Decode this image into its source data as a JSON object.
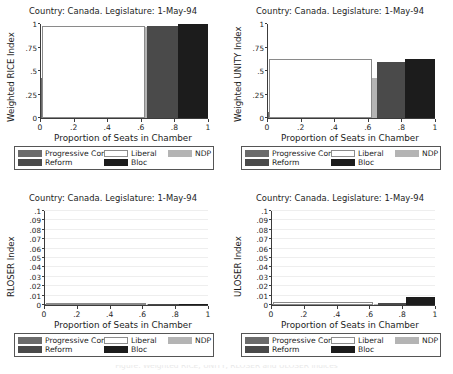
{
  "figure": {
    "width": 453,
    "height": 374,
    "background": "#ffffff",
    "cut_off_caption": "Figure: Weighted RICE, UNITY, RLOSER and ULOSER indices"
  },
  "parties": [
    {
      "key": "pc",
      "label": "Progressive Con",
      "color": "#6b6b6b",
      "outline": false
    },
    {
      "key": "liberal",
      "label": "Liberal",
      "color": "#ffffff",
      "outline": true
    },
    {
      "key": "ndp",
      "label": "NDP",
      "color": "#b4b4b4",
      "outline": false
    },
    {
      "key": "reform",
      "label": "Reform",
      "color": "#4a4a4a",
      "outline": false
    },
    {
      "key": "bloc",
      "label": "Bloc",
      "color": "#1c1c1c",
      "outline": false
    }
  ],
  "legend": {
    "row1": [
      "Progressive Con",
      "Liberal",
      "NDP"
    ],
    "row2": [
      "Reform",
      "Bloc"
    ]
  },
  "panels": [
    {
      "id": "rice",
      "title": "Country: Canada. Legislature: 1-May-94",
      "ylabel": "Weighted RICE Index",
      "xlabel": "Proportion of Seats in Chamber"
    },
    {
      "id": "unity",
      "title": "Country: Canada. Legislature: 1-May-94",
      "ylabel": "Weighted UNITY Index",
      "xlabel": "Proportion of Seats in Chamber"
    },
    {
      "id": "rloser",
      "title": "Country: Canada. Legislature: 1-May-94",
      "ylabel": "RLOSER Index",
      "xlabel": "Proportion of Seats in Chamber"
    },
    {
      "id": "uloser",
      "title": "Country: Canada. Legislature: 1-May-94",
      "ylabel": "ULOSER Index",
      "xlabel": "Proportion of Seats in Chamber"
    }
  ],
  "chart_data": [
    {
      "type": "bar",
      "id": "rice",
      "title": "Country: Canada. Legislature: 1-May-94",
      "xlabel": "Proportion of Seats in Chamber",
      "ylabel": "Weighted RICE Index",
      "xlim": [
        0,
        1
      ],
      "ylim": [
        0,
        1
      ],
      "xticks": [
        0,
        0.2,
        0.4,
        0.6,
        0.8,
        1
      ],
      "xticklabels": [
        "0",
        ".2",
        ".4",
        ".6",
        ".8",
        "1"
      ],
      "yticks": [
        0,
        0.25,
        0.5,
        0.75,
        1
      ],
      "yticklabels": [
        "0",
        ".25",
        ".5",
        ".75",
        "1"
      ],
      "grid": false,
      "legend_position": "below",
      "note": "width of each bar = that party's share of seats; height = index value",
      "bars": [
        {
          "party": "Progressive Con",
          "x0": 0.0,
          "x1": 0.013,
          "value": 0.43
        },
        {
          "party": "Liberal",
          "x0": 0.013,
          "x1": 0.625,
          "value": 0.98
        },
        {
          "party": "NDP",
          "x0": 0.625,
          "x1": 0.637,
          "value": 0.97
        },
        {
          "party": "Reform",
          "x0": 0.637,
          "x1": 0.822,
          "value": 0.975
        },
        {
          "party": "Bloc",
          "x0": 0.822,
          "x1": 1.0,
          "value": 1.0
        }
      ]
    },
    {
      "type": "bar",
      "id": "unity",
      "title": "Country: Canada. Legislature: 1-May-94",
      "xlabel": "Proportion of Seats in Chamber",
      "ylabel": "Weighted UNITY Index",
      "xlim": [
        0,
        1
      ],
      "ylim": [
        0,
        1
      ],
      "xticks": [
        0,
        0.2,
        0.4,
        0.6,
        0.8,
        1
      ],
      "xticklabels": [
        "0",
        ".2",
        ".4",
        ".6",
        ".8",
        "1"
      ],
      "yticks": [
        0,
        0.25,
        0.5,
        0.75,
        1
      ],
      "yticklabels": [
        "0",
        ".25",
        ".5",
        ".75",
        "1"
      ],
      "grid": false,
      "legend_position": "below",
      "bars": [
        {
          "party": "Progressive Con",
          "x0": 0.0,
          "x1": 0.013,
          "value": 0.06
        },
        {
          "party": "Liberal",
          "x0": 0.013,
          "x1": 0.625,
          "value": 0.625
        },
        {
          "party": "NDP",
          "x0": 0.625,
          "x1": 0.655,
          "value": 0.43
        },
        {
          "party": "Reform",
          "x0": 0.655,
          "x1": 0.822,
          "value": 0.595
        },
        {
          "party": "Bloc",
          "x0": 0.822,
          "x1": 1.0,
          "value": 0.625
        }
      ]
    },
    {
      "type": "bar",
      "id": "rloser",
      "title": "Country: Canada. Legislature: 1-May-94",
      "xlabel": "Proportion of Seats in Chamber",
      "ylabel": "RLOSER Index",
      "xlim": [
        0,
        1
      ],
      "ylim": [
        0,
        0.1
      ],
      "xticks": [
        0,
        0.2,
        0.4,
        0.6,
        0.8,
        1
      ],
      "xticklabels": [
        "0",
        ".2",
        ".4",
        ".6",
        ".8",
        "1"
      ],
      "yticks": [
        0,
        0.01,
        0.02,
        0.03,
        0.04,
        0.05,
        0.06,
        0.07,
        0.08,
        0.09,
        0.1
      ],
      "yticklabels": [
        "0",
        ".01",
        ".02",
        ".03",
        ".04",
        ".05",
        ".06",
        ".07",
        ".08",
        ".09",
        ".1"
      ],
      "grid": true,
      "legend_position": "below",
      "bars": [
        {
          "party": "Progressive Con",
          "x0": 0.0,
          "x1": 0.013,
          "value": 0.0
        },
        {
          "party": "Liberal",
          "x0": 0.013,
          "x1": 0.625,
          "value": 0.0022
        },
        {
          "party": "NDP",
          "x0": 0.625,
          "x1": 0.637,
          "value": 0.0
        },
        {
          "party": "Reform",
          "x0": 0.637,
          "x1": 0.822,
          "value": 0.0
        },
        {
          "party": "Bloc",
          "x0": 0.822,
          "x1": 1.0,
          "value": 0.0
        }
      ]
    },
    {
      "type": "bar",
      "id": "uloser",
      "title": "Country: Canada. Legislature: 1-May-94",
      "xlabel": "Proportion of Seats in Chamber",
      "ylabel": "ULOSER Index",
      "xlim": [
        0,
        1
      ],
      "ylim": [
        0,
        0.1
      ],
      "xticks": [
        0,
        0.2,
        0.4,
        0.6,
        0.8,
        1
      ],
      "xticklabels": [
        "0",
        ".2",
        ".4",
        ".6",
        ".8",
        "1"
      ],
      "yticks": [
        0,
        0.01,
        0.02,
        0.03,
        0.04,
        0.05,
        0.06,
        0.07,
        0.08,
        0.09,
        0.1
      ],
      "yticklabels": [
        "0",
        ".01",
        ".02",
        ".03",
        ".04",
        ".05",
        ".06",
        ".07",
        ".08",
        ".09",
        ".1"
      ],
      "grid": true,
      "legend_position": "below",
      "bars": [
        {
          "party": "Progressive Con",
          "x0": 0.0,
          "x1": 0.013,
          "value": 0.0
        },
        {
          "party": "Liberal",
          "x0": 0.013,
          "x1": 0.625,
          "value": 0.003
        },
        {
          "party": "NDP",
          "x0": 0.625,
          "x1": 0.655,
          "value": 0.0
        },
        {
          "party": "Reform",
          "x0": 0.655,
          "x1": 0.822,
          "value": 0.0022
        },
        {
          "party": "Bloc",
          "x0": 0.822,
          "x1": 1.0,
          "value": 0.008
        }
      ]
    }
  ]
}
